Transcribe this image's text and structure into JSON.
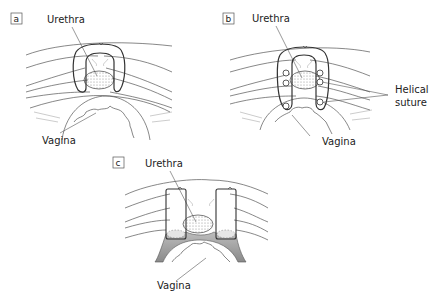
{
  "figure": {
    "panels": [
      {
        "id": "a",
        "label": "a",
        "urethra_label": "Urethra",
        "vagina_label": "Vagina"
      },
      {
        "id": "b",
        "label": "b",
        "urethra_label": "Urethra",
        "vagina_label": "Vagina",
        "helical_label_line1": "Helical",
        "helical_label_line2": "suture"
      },
      {
        "id": "c",
        "label": "c",
        "urethra_label": "Urethra",
        "vagina_label": "Vagina"
      }
    ],
    "colors": {
      "line": "#333333",
      "tissue": "#555555",
      "shade": "#9a9a9a",
      "background": "#ffffff"
    }
  }
}
